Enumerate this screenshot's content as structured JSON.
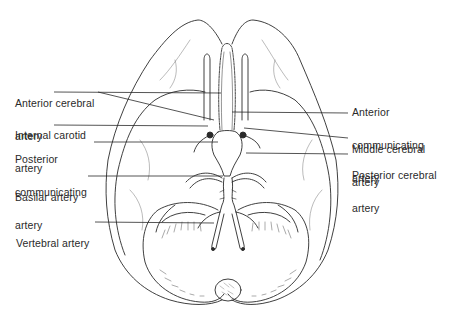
{
  "figure": {
    "colors": {
      "line": "#2a2a2a",
      "background": "#ffffff",
      "fill": "#ffffff"
    }
  },
  "labels": {
    "left": [
      {
        "id": "anterior-cerebral",
        "lines": [
          "Anterior cerebral",
          "artery"
        ]
      },
      {
        "id": "internal-carotid",
        "lines": [
          "Internal carotid",
          "artery"
        ]
      },
      {
        "id": "posterior-communicating",
        "lines": [
          "Posterior",
          "communicating",
          "artery"
        ]
      },
      {
        "id": "basilar",
        "lines": [
          "Basilar artery"
        ]
      },
      {
        "id": "vertebral",
        "lines": [
          "Vertebral artery"
        ]
      }
    ],
    "right": [
      {
        "id": "anterior-communicating",
        "lines": [
          "Anterior",
          "communicating",
          "artery"
        ]
      },
      {
        "id": "middle-cerebral",
        "lines": [
          "Middle cerebral",
          "artery"
        ]
      },
      {
        "id": "posterior-cerebral",
        "lines": [
          "Posterior cerebral",
          "artery"
        ]
      }
    ]
  }
}
